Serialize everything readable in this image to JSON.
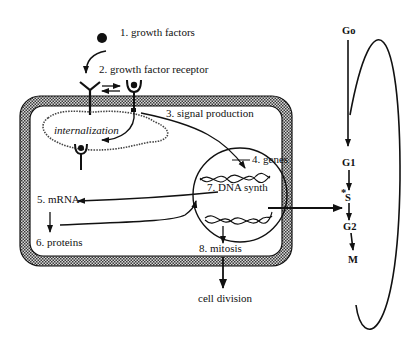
{
  "diagram": {
    "cell_labels": {
      "step1": "1.  growth factors",
      "step2": "2.  growth factor receptor",
      "step3": "3.  signal production",
      "step4": "4.  genes",
      "step5": "5.  mRNA",
      "step6": "6.  proteins",
      "step7": "7.  DNA synth",
      "step8": "8.  mitosis",
      "internalization": "internalization",
      "cell_division": "cell division"
    },
    "cell_cycle": {
      "phases": [
        "Go",
        "G1",
        "S",
        "G2",
        "M"
      ],
      "g0": "Go",
      "g1": "G1",
      "s": "S",
      "s_marker": "*",
      "g2": "G2",
      "m": "M"
    },
    "colors": {
      "ink": "#111111",
      "background": "#ffffff",
      "membrane_fill": "#8a8a8a"
    }
  }
}
